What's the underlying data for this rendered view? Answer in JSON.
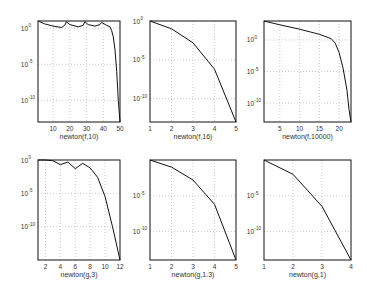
{
  "figure": {
    "layout": "2x3 grid of log-scale convergence plots"
  },
  "chart_data": [
    {
      "type": "line",
      "title": "",
      "xlabel": "newton(f,10)",
      "ylabel": "",
      "yscale": "log",
      "xlim": [
        1,
        50
      ],
      "ylim_exp": [
        -13,
        1
      ],
      "xticks": [
        10,
        20,
        30,
        40,
        50
      ],
      "yticks": [
        "10^0",
        "10^-5",
        "10^-10"
      ],
      "ytick_exp": [
        0,
        -5,
        -10
      ],
      "grid": true,
      "series": [
        {
          "name": "error",
          "x": [
            1,
            2,
            5,
            10,
            15,
            17,
            18,
            20,
            25,
            28,
            29,
            31,
            35,
            38,
            39,
            42,
            44,
            45,
            46,
            47,
            48,
            49,
            50
          ],
          "log10y": [
            1,
            0.9,
            0.6,
            0.3,
            0.1,
            0.4,
            0.9,
            0.5,
            0.2,
            0.4,
            0.9,
            0.5,
            0.3,
            0.5,
            0.8,
            0.4,
            0.2,
            -0.3,
            -1.2,
            -3,
            -6,
            -10,
            -13
          ]
        }
      ]
    },
    {
      "type": "line",
      "xlabel": "newton(f,16)",
      "yscale": "log",
      "xlim": [
        1,
        5
      ],
      "ylim_exp": [
        -13,
        0
      ],
      "xticks": [
        1,
        2,
        3,
        4,
        5
      ],
      "yticks": [
        "10^0",
        "10^-5",
        "10^-10"
      ],
      "ytick_exp": [
        0,
        -5,
        -10
      ],
      "grid": true,
      "series": [
        {
          "name": "error",
          "x": [
            1,
            2,
            3,
            4,
            5
          ],
          "log10y": [
            0,
            -1,
            -2.8,
            -6.2,
            -13
          ]
        }
      ]
    },
    {
      "type": "line",
      "xlabel": "newton(f,10000)",
      "yscale": "log",
      "xlim": [
        1,
        23
      ],
      "ylim_exp": [
        -13,
        3
      ],
      "xticks": [
        5,
        10,
        15,
        20
      ],
      "yticks": [
        "10^0",
        "10^-5",
        "10^-10"
      ],
      "ytick_exp": [
        0,
        -5,
        -10
      ],
      "grid": true,
      "series": [
        {
          "name": "error",
          "x": [
            1,
            5,
            10,
            15,
            18,
            19,
            20,
            21,
            22,
            22.5,
            23
          ],
          "log10y": [
            3,
            2.4,
            1.7,
            0.9,
            0.2,
            -0.5,
            -2,
            -4.5,
            -8,
            -11,
            -13
          ]
        }
      ]
    },
    {
      "type": "line",
      "xlabel": "newton(g,3)",
      "yscale": "log",
      "xlim": [
        1,
        12
      ],
      "ylim_exp": [
        -15,
        0
      ],
      "xticks": [
        2,
        4,
        6,
        8,
        10,
        12
      ],
      "yticks": [
        "10^0",
        "10^-5",
        "10^-10"
      ],
      "ytick_exp": [
        0,
        -5,
        -10
      ],
      "grid": true,
      "series": [
        {
          "name": "error",
          "x": [
            1,
            2,
            3,
            4,
            5,
            6,
            7,
            8,
            9,
            10,
            11,
            12
          ],
          "log10y": [
            0,
            0,
            -0.1,
            -0.7,
            -0.3,
            -1.3,
            -0.5,
            -1.2,
            -2.6,
            -5.5,
            -10,
            -15
          ]
        }
      ]
    },
    {
      "type": "line",
      "xlabel": "newton(g,1.3)",
      "yscale": "log",
      "xlim": [
        1,
        5
      ],
      "ylim_exp": [
        -14,
        0
      ],
      "xticks": [
        1,
        2,
        3,
        4,
        5
      ],
      "yticks": [
        "10^-5",
        "10^-10"
      ],
      "ytick_exp": [
        -5,
        -10
      ],
      "grid": true,
      "series": [
        {
          "name": "error",
          "x": [
            1,
            2,
            3,
            4,
            5
          ],
          "log10y": [
            0,
            -1,
            -2.8,
            -6.2,
            -14
          ]
        }
      ]
    },
    {
      "type": "line",
      "xlabel": "newton(g,1)",
      "yscale": "log",
      "xlim": [
        1,
        4
      ],
      "ylim_exp": [
        -14,
        0
      ],
      "xticks": [
        1,
        2,
        3,
        4
      ],
      "yticks": [
        "10^-5",
        "10^-10"
      ],
      "ytick_exp": [
        -5,
        -10
      ],
      "grid": true,
      "series": [
        {
          "name": "error",
          "x": [
            1,
            2,
            3,
            4
          ],
          "log10y": [
            0,
            -2,
            -6.5,
            -14
          ]
        }
      ]
    }
  ]
}
